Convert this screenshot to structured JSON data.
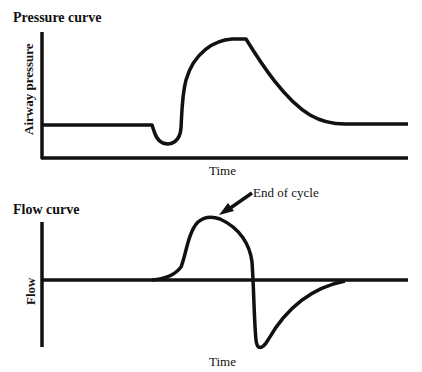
{
  "panels": {
    "pressure": {
      "title": "Pressure curve",
      "ylabel": "Airway pressure",
      "xlabel": "Time"
    },
    "flow": {
      "title": "Flow curve",
      "ylabel": "Flow",
      "xlabel": "Time",
      "annotation": "End of cycle"
    }
  },
  "colors": {
    "line": "#111111",
    "background": "#ffffff"
  }
}
